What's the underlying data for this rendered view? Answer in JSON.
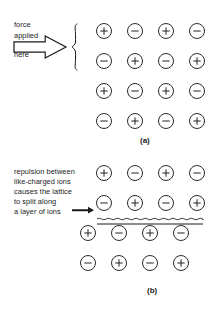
{
  "figure": {
    "background_color": "#ffffff",
    "ink_color": "#1a1a1a",
    "width": 223,
    "height": 309
  },
  "panels": [
    {
      "id": "a",
      "label": "(a)",
      "label_x": 140,
      "label_y": 136,
      "annotation": {
        "lines": [
          "force",
          "applied",
          "here"
        ],
        "line_y": [
          20,
          31,
          50
        ],
        "line_x": 14,
        "arrow": {
          "name": "block-arrow-right",
          "x": 14,
          "y": 36,
          "width": 52,
          "height": 22
        },
        "brace": {
          "name": "curly-brace-left",
          "x": 72,
          "y": 24,
          "height": 46,
          "spans_rows": 2
        }
      },
      "lattice": {
        "origin_x": 96,
        "origin_y": 23,
        "col_step": 31,
        "row_step": 30,
        "ion_size": 16,
        "rows": [
          {
            "offset_x": 0,
            "charges": [
              "+",
              "-",
              "+",
              "-"
            ]
          },
          {
            "offset_x": 0,
            "charges": [
              "-",
              "+",
              "-",
              "+"
            ]
          },
          {
            "offset_x": 0,
            "charges": [
              "+",
              "-",
              "+",
              "-"
            ]
          },
          {
            "offset_x": 0,
            "charges": [
              "-",
              "+",
              "-",
              "+"
            ]
          }
        ]
      }
    },
    {
      "id": "b",
      "label": "(b)",
      "label_x": 147,
      "label_y": 286,
      "annotation": {
        "lines": [
          "repulsion between",
          "like-charged ions",
          "causes the lattice",
          "to split along",
          "a layer of ions"
        ],
        "line_y": [
          167,
          177,
          187,
          197,
          207
        ],
        "line_x": 14,
        "pointer_arrow": {
          "name": "pointer-arrow-right",
          "x": 72,
          "y": 210,
          "length": 22
        }
      },
      "split": {
        "name": "cleavage-plane",
        "wavy_line": {
          "x": 97,
          "y": 219,
          "width": 106,
          "amplitude": 1.6,
          "wavelength": 4.6
        },
        "straight_line": {
          "x": 97,
          "y": 224,
          "width": 106
        }
      },
      "lattice": {
        "origin_x": 96,
        "origin_y": 165,
        "col_step": 31,
        "row_step": 30,
        "ion_size": 16,
        "rows": [
          {
            "offset_x": 0,
            "charges": [
              "+",
              "-",
              "+",
              "-"
            ]
          },
          {
            "offset_x": 0,
            "charges": [
              "-",
              "+",
              "-",
              "+"
            ]
          },
          {
            "offset_x": -16,
            "charges": [
              "+",
              "-",
              "+",
              "-"
            ]
          },
          {
            "offset_x": -16,
            "charges": [
              "-",
              "+",
              "-",
              "+"
            ]
          }
        ]
      }
    }
  ]
}
